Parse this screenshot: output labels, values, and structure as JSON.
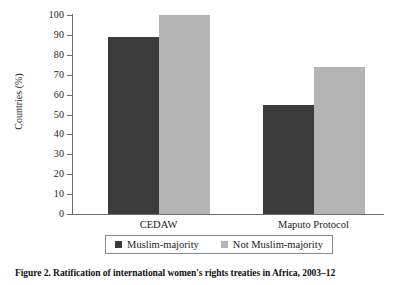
{
  "chart_data": {
    "type": "bar",
    "title": "",
    "categories": [
      "CEDAW",
      "Maputo Protocol"
    ],
    "series": [
      {
        "name": "Muslim-majority",
        "values": [
          89,
          55
        ],
        "color": "#3b3b3b"
      },
      {
        "name": "Not Muslim-majority",
        "values": [
          100,
          74
        ],
        "color": "#b4b4b4"
      }
    ],
    "xlabel": "",
    "ylabel": "Countries (%)",
    "ylim": [
      0,
      100
    ],
    "yticks": [
      0,
      10,
      20,
      30,
      40,
      50,
      60,
      70,
      80,
      90,
      100
    ],
    "ytick_labels": [
      "0",
      "10",
      "20",
      "30",
      "40",
      "50",
      "60",
      "70",
      "80",
      "90",
      "100"
    ],
    "grid": false,
    "legend_position": "bottom",
    "legend_boxed": true
  },
  "figure": {
    "caption": "Figure 2. Ratification of international women's rights treaties in Africa, 2003–12"
  },
  "axes": {
    "y_title": "Countries (%)"
  },
  "legend": {
    "entries": [
      {
        "label": "Muslim-majority"
      },
      {
        "label": "Not Muslim-majority"
      }
    ]
  }
}
